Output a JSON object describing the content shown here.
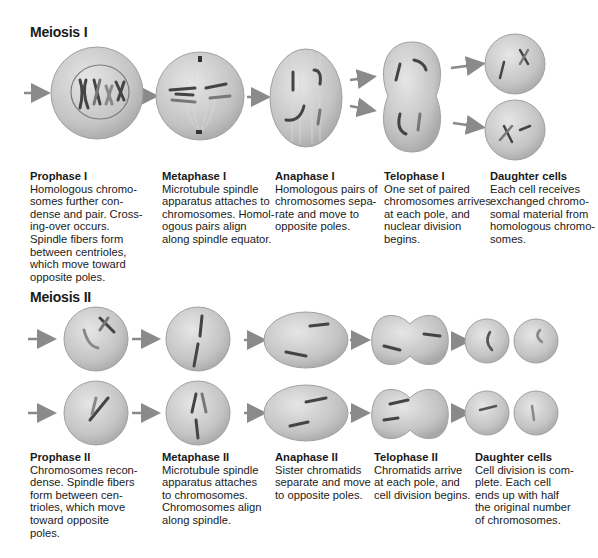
{
  "meiosis1": {
    "title": "Meiosis I",
    "stages": [
      {
        "name": "Prophase I",
        "text": "Homologous chromo-\nsomes further con-\ndense and pair. Cross-\ning-over occurs.\nSpindle fibers form\nbetween centrioles,\nwhich move toward\nopposite poles."
      },
      {
        "name": "Metaphase I",
        "text": "Microtubule spindle\napparatus attaches to\nchromosomes. Homol-\nogous pairs align\nalong spindle equator."
      },
      {
        "name": "Anaphase I",
        "text": "Homologous pairs of\nchromosomes sepa-\nrate and move to\nopposite poles."
      },
      {
        "name": "Telophase I",
        "text": "One set of paired\nchromosomes arrives\nat each pole, and\nnuclear division\nbegins."
      },
      {
        "name": "Daughter cells",
        "text": "Each cell receives\nexchanged chromo-\nsomal material from\nhomologous chromo-\nsomes."
      }
    ]
  },
  "meiosis2": {
    "title": "Meiosis II",
    "stages": [
      {
        "name": "Prophase II",
        "text": "Chromosomes recon-\ndense. Spindle fibers\nform between cen-\ntrioles, which move\ntoward opposite\npoles."
      },
      {
        "name": "Metaphase II",
        "text": "Microtubule spindle\napparatus attaches\nto chromosomes.\nChromosomes align\nalong spindle."
      },
      {
        "name": "Anaphase II",
        "text": "Sister chromatids\nseparate and move\nto opposite poles."
      },
      {
        "name": "Telophase II",
        "text": "Chromatids arrive\nat each pole, and\ncell division begins."
      },
      {
        "name": "Daughter cells",
        "text": "Cell division is com-\nplete. Each cell\nends up with half\nthe original number\nof chromosomes."
      }
    ]
  },
  "colors": {
    "cell_fill": "#c9c9c9",
    "cell_edge": "#9a9a9a",
    "chromosome": "#4a4a4a",
    "arrow": "#8a8a8a"
  }
}
